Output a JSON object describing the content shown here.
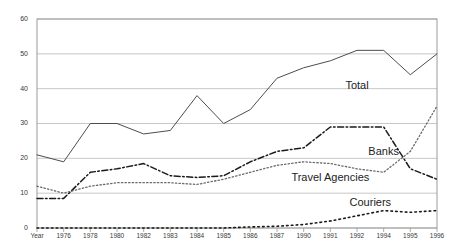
{
  "chart_data": {
    "type": "line",
    "title": "",
    "subtitle": "",
    "xlabel": "",
    "ylabel": "",
    "ylim": [
      0,
      60
    ],
    "yticks": [
      0,
      10,
      20,
      30,
      40,
      50,
      60
    ],
    "grid": true,
    "legend": "inline-annotations",
    "x_axis_first_label": "Year",
    "categories": [
      "Year",
      "1976",
      "1978",
      "1980",
      "1982",
      "1983",
      "1984",
      "1985",
      "1986",
      "1987",
      "1990",
      "1991",
      "1992",
      "1994",
      "1995",
      "1996"
    ],
    "series": [
      {
        "name": "Total",
        "style": "solid",
        "color": "#4d4d4d",
        "values": [
          21,
          19,
          30,
          30,
          27,
          28,
          38,
          30,
          34,
          43,
          46,
          48,
          51,
          51,
          44,
          50
        ]
      },
      {
        "name": "Travel Agencies",
        "style": "dash-dot",
        "color": "#1a1a1a",
        "values": [
          8.5,
          8.5,
          16,
          17,
          18.5,
          15,
          14.5,
          15,
          19,
          22,
          23,
          29,
          29,
          29,
          17,
          14
        ]
      },
      {
        "name": "Banks",
        "style": "dotted",
        "color": "#6b6b6b",
        "values": [
          12,
          10,
          12,
          13,
          13,
          13,
          12.5,
          14,
          16,
          18,
          19,
          18.5,
          17,
          16,
          22,
          35
        ]
      },
      {
        "name": "Couriers",
        "style": "dotted-sparse",
        "color": "#1a1a1a",
        "values": [
          0,
          0,
          0,
          0,
          0,
          0,
          0,
          0,
          0.3,
          0.5,
          1,
          2,
          3.5,
          5,
          4.5,
          5
        ]
      }
    ],
    "annotations": [
      {
        "text": "Total",
        "x": 1992,
        "y": 41
      },
      {
        "text": "Banks",
        "x": 1994,
        "y": 22
      },
      {
        "text": "Travel Agencies",
        "x": 1991,
        "y": 14.5
      },
      {
        "text": "Couriers",
        "x": 1993,
        "y": 7.5
      }
    ]
  }
}
